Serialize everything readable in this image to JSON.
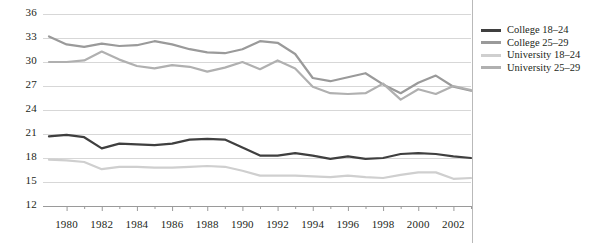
{
  "chart_data": {
    "type": "line",
    "title": "",
    "xlabel": "",
    "ylabel": "",
    "xlim": [
      1979,
      2003
    ],
    "ylim": [
      12,
      36
    ],
    "ytick_step": 3,
    "xtick_step": 2,
    "grid": true,
    "legend_position": "right",
    "yticks": [
      36,
      33,
      30,
      27,
      24,
      21,
      18,
      15,
      12
    ],
    "xticks": [
      1980,
      1982,
      1984,
      1986,
      1988,
      1990,
      1992,
      1994,
      1996,
      1998,
      2000,
      2002
    ],
    "x": [
      1979,
      1980,
      1981,
      1982,
      1983,
      1984,
      1985,
      1986,
      1987,
      1988,
      1989,
      1990,
      1991,
      1992,
      1993,
      1994,
      1995,
      1996,
      1997,
      1998,
      1999,
      2000,
      2001,
      2002,
      2003
    ],
    "series": [
      {
        "name": "College 18–24",
        "color": "#3f3f3f",
        "values": [
          20.7,
          20.9,
          20.6,
          19.2,
          19.8,
          19.7,
          19.6,
          19.8,
          20.3,
          20.4,
          20.3,
          19.3,
          18.3,
          18.3,
          18.6,
          18.3,
          17.9,
          18.2,
          17.9,
          18.0,
          18.5,
          18.6,
          18.5,
          18.2,
          18.0
        ]
      },
      {
        "name": "College 25–29",
        "color": "#9a9a9a",
        "values": [
          33.2,
          32.2,
          31.9,
          32.3,
          32.0,
          32.1,
          32.6,
          32.2,
          31.6,
          31.2,
          31.1,
          31.6,
          32.6,
          32.4,
          31.0,
          28.0,
          27.6,
          28.1,
          28.6,
          27.2,
          26.1,
          27.4,
          28.3,
          26.9,
          26.4
        ]
      },
      {
        "name": "University 18–24",
        "color": "#cfcfcf",
        "values": [
          17.8,
          17.7,
          17.5,
          16.6,
          16.9,
          16.9,
          16.8,
          16.8,
          16.9,
          17.0,
          16.9,
          16.4,
          15.8,
          15.8,
          15.8,
          15.7,
          15.6,
          15.8,
          15.6,
          15.5,
          15.9,
          16.2,
          16.2,
          15.4,
          15.5
        ]
      },
      {
        "name": "University 25–29",
        "color": "#b0b0b0",
        "values": [
          30.0,
          30.0,
          30.2,
          31.3,
          30.3,
          29.5,
          29.2,
          29.6,
          29.4,
          28.8,
          29.3,
          30.0,
          29.1,
          30.2,
          29.2,
          26.9,
          26.1,
          26.0,
          26.1,
          27.3,
          25.3,
          26.6,
          26.0,
          27.0,
          26.5
        ]
      }
    ]
  },
  "legend": {
    "items": [
      {
        "label": "College 18–24",
        "color": "#3f3f3f",
        "swatch": "legend-swatch-college-18-24"
      },
      {
        "label": "College 25–29",
        "color": "#9a9a9a",
        "swatch": "legend-swatch-college-25-29"
      },
      {
        "label": "University 18–24",
        "color": "#cfcfcf",
        "swatch": "legend-swatch-university-18-24"
      },
      {
        "label": "University 25–29",
        "color": "#b0b0b0",
        "swatch": "legend-swatch-university-25-29"
      }
    ]
  },
  "axes": {
    "y_labels": [
      "36",
      "33",
      "30",
      "27",
      "24",
      "21",
      "18",
      "15",
      "12"
    ],
    "x_labels": [
      "1980",
      "1982",
      "1984",
      "1986",
      "1988",
      "1990",
      "1992",
      "1994",
      "1996",
      "1998",
      "2000",
      "2002"
    ]
  },
  "colors": {
    "grid": "#d7d7d7",
    "axis": "#9a9a9a",
    "text": "#231f20",
    "divider": "#b9b9b9",
    "background": "#ffffff"
  }
}
